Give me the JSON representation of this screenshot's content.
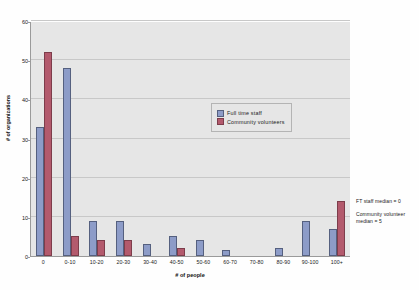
{
  "chart_data": {
    "type": "bar",
    "title": "",
    "xlabel": "# of people",
    "ylabel": "# of organizations",
    "ylim": [
      0,
      60
    ],
    "yticks": [
      0,
      10,
      20,
      30,
      40,
      50,
      60
    ],
    "grid": true,
    "legend_position": "inside-upper-center",
    "categories": [
      "0",
      "0-10",
      "10-20",
      "20-30",
      "30-40",
      "40-50",
      "50-60",
      "60-70",
      "70-80",
      "80-90",
      "90-100",
      "100+"
    ],
    "series": [
      {
        "name": "Full time staff",
        "color": "#8d9cc8",
        "values": [
          33,
          48,
          9,
          9,
          3,
          5,
          4,
          1.5,
          0,
          2,
          9,
          7
        ]
      },
      {
        "name": "Community volunteers",
        "color": "#b35a6d",
        "values": [
          52,
          5,
          4,
          4,
          0,
          2,
          0,
          0,
          0,
          0,
          0,
          14
        ]
      }
    ],
    "annotations": [
      "FT staff median = 0",
      "Community volunteer median = 5"
    ]
  },
  "legend": {
    "items": [
      {
        "label": "Full time staff"
      },
      {
        "label": "Community volunteers"
      }
    ]
  },
  "axes": {
    "x_title": "# of people",
    "y_title": "# of organizations"
  }
}
